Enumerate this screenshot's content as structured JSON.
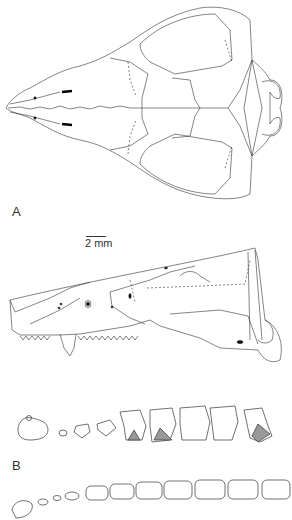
{
  "figure": {
    "panels": [
      {
        "label": "A",
        "views": [
          "dorsal view of skull",
          "lateral view of skull"
        ]
      },
      {
        "label": "B",
        "views": [
          "upper tooth row (occlusal)",
          "lower tooth row (occlusal)"
        ]
      }
    ],
    "scale_bar": {
      "text": "2 mm"
    },
    "colors": {
      "line": "#333333",
      "fill": "#ffffff",
      "shade": "#999999"
    }
  }
}
